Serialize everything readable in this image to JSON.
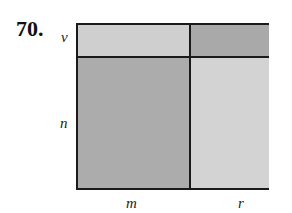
{
  "problem": {
    "number": "70."
  },
  "labels": {
    "top_row": "v",
    "bottom_row": "n",
    "left_col": "m",
    "right_col": "r"
  },
  "regions": {
    "top_left": {
      "row": "v",
      "col": "m",
      "color": "#cfcfcf"
    },
    "top_right": {
      "row": "v",
      "col": "r",
      "color": "#a9a9a9"
    },
    "bottom_left": {
      "row": "n",
      "col": "m",
      "color": "#acacac"
    },
    "bottom_right": {
      "row": "n",
      "col": "r",
      "color": "#d3d3d3"
    }
  },
  "colors": {
    "border": "#1a1a1a",
    "background": "#ffffff"
  }
}
